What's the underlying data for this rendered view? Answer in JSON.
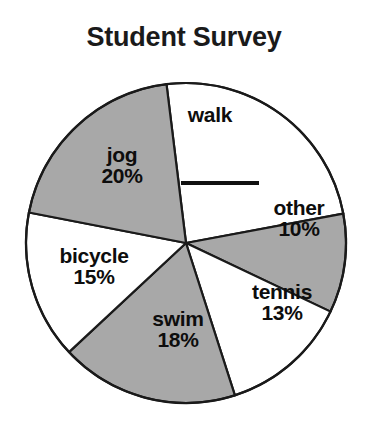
{
  "chart_data": {
    "type": "pie",
    "title": "Student Survey",
    "xlabel": "",
    "ylabel": "",
    "legend_position": "none",
    "grid": false,
    "units": "percent",
    "categories": [
      "walk",
      "other",
      "tennis",
      "swim",
      "bicycle",
      "jog"
    ],
    "values": [
      24,
      10,
      13,
      18,
      15,
      20
    ],
    "slices": [
      {
        "name": "walk",
        "label": "walk",
        "value": 24,
        "value_label": "",
        "value_shown": false,
        "fill": "#ffffff",
        "start_angle": -7,
        "end_angle": 79.4,
        "note": "percentage blank - answer line drawn instead of a number"
      },
      {
        "name": "other",
        "label": "other",
        "value": 10,
        "value_label": "10%",
        "value_shown": true,
        "fill": "#a8a8a8",
        "start_angle": 79.4,
        "end_angle": 115.4
      },
      {
        "name": "tennis",
        "label": "tennis",
        "value": 13,
        "value_label": "13%",
        "value_shown": true,
        "fill": "#ffffff",
        "start_angle": 115.4,
        "end_angle": 162.2
      },
      {
        "name": "swim",
        "label": "swim",
        "value": 18,
        "value_label": "18%",
        "value_shown": true,
        "fill": "#a8a8a8",
        "start_angle": 162.2,
        "end_angle": 227.0
      },
      {
        "name": "bicycle",
        "label": "bicycle",
        "value": 15,
        "value_label": "15%",
        "value_shown": true,
        "fill": "#ffffff",
        "start_angle": 227.0,
        "end_angle": 281.0
      },
      {
        "name": "jog",
        "label": "jog",
        "value": 20,
        "value_label": "20%",
        "value_shown": true,
        "fill": "#a8a8a8",
        "start_angle": 281.0,
        "end_angle": 353.0
      }
    ],
    "total": 100,
    "colors": {
      "shaded_slice": "#a8a8a8",
      "unshaded_slice": "#ffffff",
      "outline": "#1a1a1a",
      "text": "#0d0d0d",
      "background": "#ffffff"
    },
    "geometry": {
      "center_x": 186,
      "center_y": 243,
      "radius": 160
    },
    "blank_answer_line": {
      "name": "walk-percent-blank",
      "present": true
    }
  }
}
